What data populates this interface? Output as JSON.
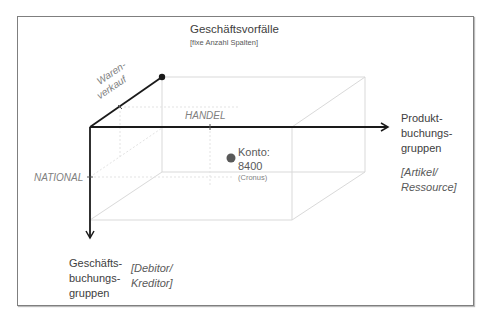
{
  "diagram": {
    "top_axis": {
      "title": "Geschäftsvorfälle",
      "subtitle": "[fixe Anzahl Spalten]",
      "member_label_line1": "Waren-",
      "member_label_line2": "verkauf"
    },
    "right_axis": {
      "title_line1": "Produkt-",
      "title_line2": "buchungs-",
      "title_line3": "gruppen",
      "hint_line1": "[Artikel/",
      "hint_line2": "Ressource]",
      "member_label": "HANDEL"
    },
    "down_axis": {
      "title_line1": "Geschäfts-",
      "title_line2": "buchungs-",
      "title_line3": "gruppen",
      "hint_line1": "[Debitor/",
      "hint_line2": "Kreditor]",
      "member_label": "NATIONAL"
    },
    "point": {
      "label_line1": "Konto:",
      "label_line2": "8400",
      "note": "(Cronus)"
    },
    "colors": {
      "axis": "#1a1a1a",
      "box": "#d9d9d9",
      "dot": "#595959",
      "frame": "#7f7f7f"
    }
  }
}
